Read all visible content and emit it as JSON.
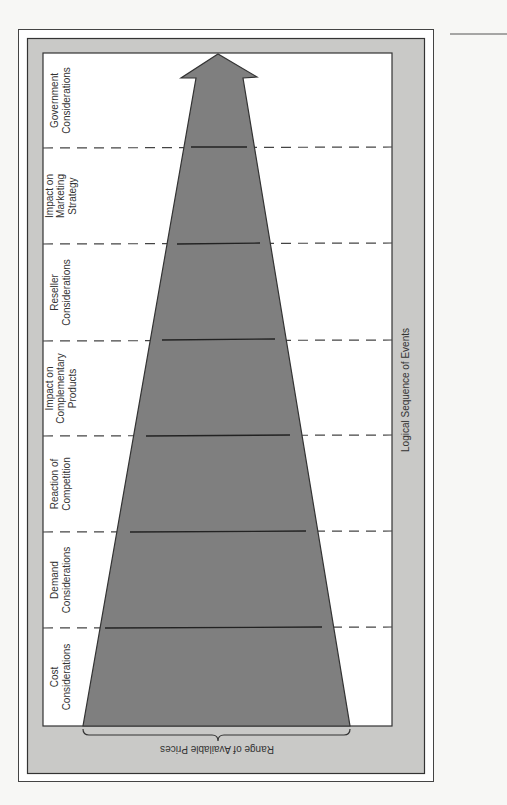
{
  "diagram": {
    "axis_label_vertical": "Logical Sequence of Events",
    "axis_label_horizontal": "Range of Available Prices",
    "stages": [
      {
        "lines": [
          "Government",
          "Considerations"
        ]
      },
      {
        "lines": [
          "Impact on",
          "Marketing",
          "Strategy"
        ]
      },
      {
        "lines": [
          "Reseller",
          "Considerations"
        ]
      },
      {
        "lines": [
          "Impact on",
          "Complementary",
          "Products"
        ]
      },
      {
        "lines": [
          "Reaction of",
          "Competition"
        ]
      },
      {
        "lines": [
          "Demand",
          "Considerations"
        ]
      },
      {
        "lines": [
          "Cost",
          "Considerations"
        ]
      }
    ],
    "colors": {
      "page": "#f7f7f5",
      "panel": "#c9c9c7",
      "inner": "#ffffff",
      "funnel": "#7f7f7f",
      "line": "#333333"
    }
  }
}
